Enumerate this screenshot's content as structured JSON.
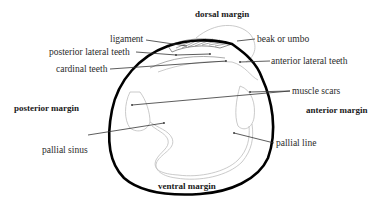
{
  "diagram": {
    "margins": {
      "dorsal": "dorsal margin",
      "ventral": "ventral margin",
      "anterior": "anterior margin",
      "posterior": "posterior margin"
    },
    "labels": {
      "ligament": "ligament",
      "posterior_lateral_teeth": "posterior lateral teeth",
      "cardinal_teeth": "cardinal teeth",
      "beak_or_umbo": "beak or umbo",
      "anterior_lateral_teeth": "anterior lateral teeth",
      "muscle_scars": "muscle scars",
      "pallial_sinus": "pallial sinus",
      "pallial_line": "pallial line"
    },
    "colors": {
      "outline": "#000000",
      "text": "#2a2a2a",
      "faint_line": "#bdbdbd"
    }
  }
}
